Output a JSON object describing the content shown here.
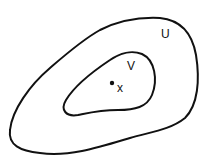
{
  "diagram": {
    "outer_set": {
      "label": "U"
    },
    "inner_set": {
      "label": "V"
    },
    "point": {
      "label": "x"
    },
    "colors": {
      "stroke": "#111111",
      "background": "#ffffff"
    }
  }
}
